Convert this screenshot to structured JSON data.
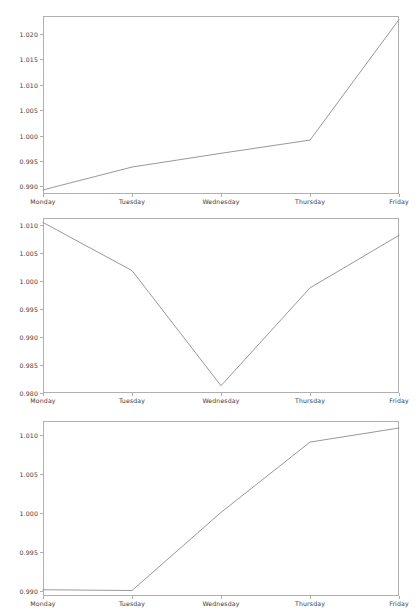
{
  "figure": {
    "width": 419,
    "height": 616,
    "background": "#ffffff",
    "line_color": "#8c8c8c",
    "axis_color": "#b0b0b0",
    "tick_text_color": "#3a3a3a"
  },
  "chart_data": [
    {
      "type": "line",
      "title": "",
      "xlabel": "",
      "ylabel": "",
      "grid": false,
      "legend": false,
      "categories": [
        "Monday",
        "Tuesday",
        "Wednesday",
        "Thursday",
        "Friday"
      ],
      "values": [
        0.9893,
        0.9938,
        0.9965,
        0.9991,
        1.0228
      ],
      "yticks": [
        "0.990",
        "0.995",
        "1.000",
        "1.005",
        "1.010",
        "1.015",
        "1.020"
      ],
      "ytick_values": [
        0.99,
        0.995,
        1.0,
        1.005,
        1.01,
        1.015,
        1.02
      ],
      "ylim": [
        0.9885,
        1.0235
      ],
      "xlim": [
        0,
        4
      ]
    },
    {
      "type": "line",
      "title": "",
      "xlabel": "",
      "ylabel": "",
      "grid": false,
      "legend": false,
      "categories": [
        "Monday",
        "Tuesday",
        "Wednesday",
        "Thursday",
        "Friday"
      ],
      "values": [
        1.0105,
        1.0019,
        0.9813,
        0.9988,
        1.0082
      ],
      "yticks": [
        "0.980",
        "0.985",
        "0.990",
        "0.995",
        "1.000",
        "1.005",
        "1.010"
      ],
      "ytick_values": [
        0.98,
        0.985,
        0.99,
        0.995,
        1.0,
        1.005,
        1.01
      ],
      "ylim": [
        0.98,
        1.0113
      ],
      "xlim": [
        0,
        4
      ]
    },
    {
      "type": "line",
      "title": "",
      "xlabel": "",
      "ylabel": "",
      "grid": false,
      "legend": false,
      "categories": [
        "Monday",
        "Tuesday",
        "Wednesday",
        "Thursday",
        "Friday"
      ],
      "values": [
        0.9902,
        0.9901,
        1.0001,
        1.0091,
        1.0109
      ],
      "yticks": [
        "0.990",
        "0.995",
        "1.000",
        "1.005",
        "1.010"
      ],
      "ytick_values": [
        0.99,
        0.995,
        1.0,
        1.005,
        1.01
      ],
      "ylim": [
        0.9894,
        1.0118
      ],
      "xlim": [
        0,
        4
      ]
    }
  ]
}
